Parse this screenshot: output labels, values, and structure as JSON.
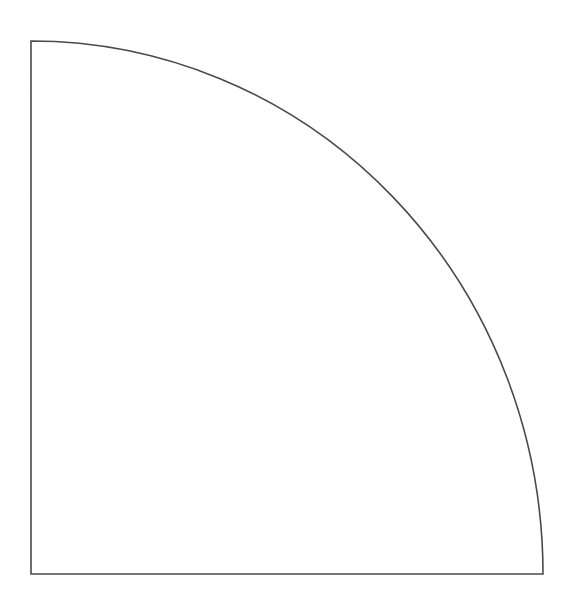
{
  "figure": {
    "name": "quarter-circle-sector",
    "canvas": {
      "width": 569,
      "height": 595,
      "background_color": "#ffffff"
    },
    "style": {
      "stroke_color": "#4a4a4a",
      "stroke_width": 1.6,
      "fill_color": "none"
    },
    "geometry": {
      "center_x": 31,
      "center_y": 574,
      "radius_x": 512,
      "radius_y": 533,
      "start_angle_deg": 90,
      "end_angle_deg": 0,
      "vertex_top_left": [
        31,
        41
      ],
      "vertex_bottom_left": [
        31,
        574
      ],
      "vertex_bottom_right": [
        543,
        574
      ]
    },
    "edges": [
      {
        "name": "left-radius-edge",
        "type": "line",
        "from": [
          31,
          41
        ],
        "to": [
          31,
          574
        ]
      },
      {
        "name": "bottom-radius-edge",
        "type": "line",
        "from": [
          31,
          574
        ],
        "to": [
          543,
          574
        ]
      },
      {
        "name": "arc-edge",
        "type": "elliptical-arc",
        "from": [
          31,
          41
        ],
        "to": [
          543,
          574
        ],
        "radius_x": 512,
        "radius_y": 533,
        "large_arc": 0,
        "sweep": 1
      }
    ],
    "path_d": "M 31 41 L 31 574 L 543 574 A 512 533 0 0 0 31 41 Z"
  }
}
